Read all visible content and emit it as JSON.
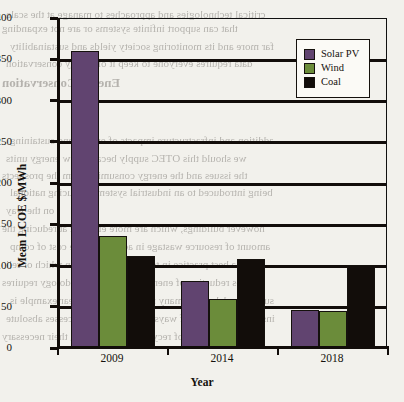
{
  "chart_data": {
    "type": "bar",
    "title": "",
    "xlabel": "Year",
    "ylabel": "Mean LCOE $/MWh",
    "categories": [
      "2009",
      "2014",
      "2018"
    ],
    "series": [
      {
        "name": "Solar PV",
        "color": "#614470",
        "values": [
          359,
          80,
          45
        ]
      },
      {
        "name": "Wind",
        "color": "#6b8c3a",
        "values": [
          134,
          58,
          44
        ]
      },
      {
        "name": "Coal",
        "color": "#120d0a",
        "values": [
          110,
          107,
          99
        ]
      }
    ],
    "ylim": [
      0,
      400
    ],
    "yticks": [
      0,
      50,
      100,
      150,
      200,
      250,
      300,
      350,
      400
    ],
    "ytick_labels": [
      "0",
      "50",
      "100",
      "150",
      "200",
      "250",
      "300",
      "350",
      "400"
    ],
    "grid": true,
    "legend_position": "top-right"
  },
  "legend": {
    "items": [
      {
        "label": "Solar PV",
        "color": "#614470"
      },
      {
        "label": "Wind",
        "color": "#6b8c3a"
      },
      {
        "label": "Coal",
        "color": "#120d0a"
      }
    ]
  },
  "background_text": {
    "lines": [
      "critical technologies and approaches to manage at the scale",
      "that can support infinite systems or are not expanding",
      "far more and its monitoring society yields and sustainability",
      "data requires everyone to keep it of energy conservation",
      "Energy Conservation",
      "addition and infrastructure impacts of energy and sustaining",
      "we should this OTEC supply because low energy units",
      "the issues and the energy consuming from the prospects",
      "being introduced to an industrial systems, reducing national",
      "on the way",
      "however buildings, which are more efficient at reducing the",
      "amount of resource wastage in addition to the cost of comp",
      "it is a best practice in terms of reduction on which or reli",
      "enables reduction of energy as such a methodology requires",
      "such a model and in many manufacturing a clear example is",
      "instead a transition of ways to eliminating processes absolute",
      "develop any of recycling and reducing their necessary"
    ]
  }
}
